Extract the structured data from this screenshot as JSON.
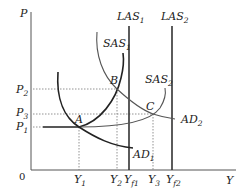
{
  "diagram": {
    "type": "AD-AS macroeconomic model",
    "axes": {
      "y_label": "P",
      "x_label": "Y",
      "origin_label": "0"
    },
    "price_levels": [
      {
        "label": "P",
        "sub": "2"
      },
      {
        "label": "P",
        "sub": "3"
      },
      {
        "label": "P",
        "sub": "1"
      }
    ],
    "output_levels": [
      {
        "label": "Y",
        "sub": "1"
      },
      {
        "label": "Y",
        "sub": "2"
      },
      {
        "label": "Y",
        "sub": "f1"
      },
      {
        "label": "Y",
        "sub": "3"
      },
      {
        "label": "Y",
        "sub": "f2"
      }
    ],
    "curves": {
      "las1": {
        "label": "LAS",
        "sub": "1"
      },
      "las2": {
        "label": "LAS",
        "sub": "2"
      },
      "sas1": {
        "label": "SAS",
        "sub": "1"
      },
      "sas2": {
        "label": "SAS",
        "sub": "2"
      },
      "ad1": {
        "label": "AD",
        "sub": "1"
      },
      "ad2": {
        "label": "AD",
        "sub": "2"
      }
    },
    "points": {
      "a": "A",
      "b": "B",
      "c": "C"
    }
  }
}
